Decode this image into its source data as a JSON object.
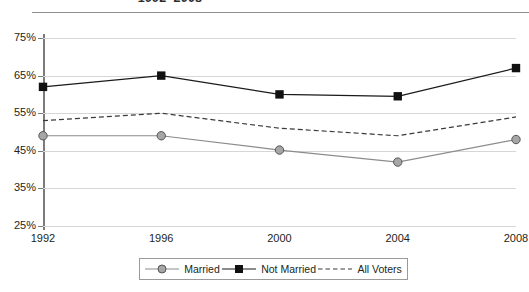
{
  "chart_data": {
    "type": "line",
    "title": "1992–2008",
    "xlabel": "",
    "ylabel": "",
    "x": [
      1992,
      1996,
      2000,
      2004,
      2008
    ],
    "categories": [
      "1992",
      "1996",
      "2000",
      "2004",
      "2008"
    ],
    "ylim": [
      25,
      75
    ],
    "ytick_labels": [
      "75%",
      "65%",
      "55%",
      "45%",
      "35%",
      "25%"
    ],
    "ytick_values": [
      75,
      65,
      55,
      45,
      35,
      25
    ],
    "grid": true,
    "legend_position": "bottom",
    "series": [
      {
        "name": "Married",
        "values": [
          49,
          49,
          45.2,
          42,
          48
        ],
        "marker": "circle",
        "color": "#8c8c8c",
        "line_style": "solid"
      },
      {
        "name": "Not Married",
        "values": [
          62,
          65,
          60,
          59.5,
          67
        ],
        "marker": "square",
        "color": "#1a1a1a",
        "line_style": "solid"
      },
      {
        "name": "All Voters",
        "values": [
          53,
          55,
          51,
          49,
          54
        ],
        "marker": "none",
        "color": "#3a3a3a",
        "line_style": "dashed"
      }
    ]
  },
  "colors": {
    "gridline": "#d6d6d6",
    "axis": "#7b7b7b",
    "rule": "#8f8f8f",
    "text": "#231f20",
    "background": "#ffffff"
  },
  "legend": {
    "items": [
      {
        "label": "Married"
      },
      {
        "label": "Not Married"
      },
      {
        "label": "All Voters"
      }
    ]
  }
}
